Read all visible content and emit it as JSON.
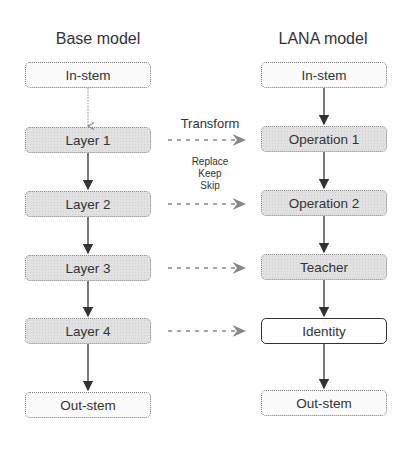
{
  "base_model": {
    "title": "Base model",
    "blocks": [
      {
        "label": "In-stem",
        "style": "plain"
      },
      {
        "label": "Layer 1",
        "style": "shaded"
      },
      {
        "label": "Layer 2",
        "style": "shaded"
      },
      {
        "label": "Layer 3",
        "style": "shaded"
      },
      {
        "label": "Layer 4",
        "style": "shaded"
      },
      {
        "label": "Out-stem",
        "style": "plain"
      }
    ]
  },
  "lana_model": {
    "title": "LANA model",
    "blocks": [
      {
        "label": "In-stem",
        "style": "plain"
      },
      {
        "label": "Operation 1",
        "style": "shaded"
      },
      {
        "label": "Operation 2",
        "style": "shaded"
      },
      {
        "label": "Teacher",
        "style": "shaded"
      },
      {
        "label": "Identity",
        "style": "solid"
      },
      {
        "label": "Out-stem",
        "style": "plain"
      }
    ]
  },
  "transform": {
    "title": "Transform",
    "options": [
      "Replace",
      "Keep",
      "Skip"
    ]
  },
  "colors": {
    "text": "#333333",
    "box_border": "#777777",
    "shaded_fill": "#e2e2e2",
    "arrow": "#333333",
    "dashed_arrow": "#888888"
  }
}
